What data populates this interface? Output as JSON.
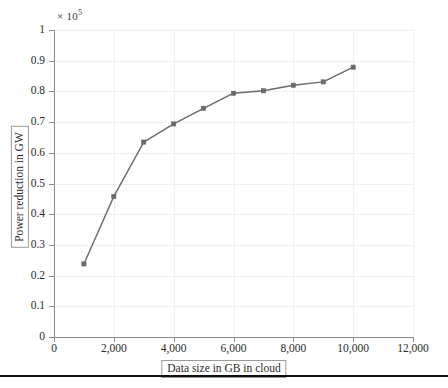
{
  "chart_data": {
    "type": "line",
    "title": "",
    "subtitle": "",
    "xlabel": "Data size in GB in cloud",
    "ylabel": "Power reduction in GW",
    "exponent_label": "× 10",
    "exponent_superscript": "5",
    "y_scale_factor": 100000,
    "xlim": [
      0,
      12000
    ],
    "ylim": [
      0,
      1
    ],
    "xticks": [
      0,
      2000,
      4000,
      6000,
      8000,
      10000,
      12000
    ],
    "xtick_labels": [
      "0",
      "2,000",
      "4,000",
      "6,000",
      "8,000",
      "10,000",
      "12,000"
    ],
    "yticks": [
      0,
      0.1,
      0.2,
      0.3,
      0.4,
      0.5,
      0.6,
      0.7,
      0.8,
      0.9,
      1
    ],
    "ytick_labels": [
      "0",
      "0.1",
      "0.2",
      "0.3",
      "0.4",
      "0.5",
      "0.6",
      "0.7",
      "0.8",
      "0.9",
      "1"
    ],
    "grid": true,
    "legend": false,
    "legend_position": "none",
    "marker": "square",
    "line_color": "#6b6b6b",
    "marker_color": "#6b6b6b",
    "grid_color": "#f0f0f2",
    "axis_color": "#8a8a8a",
    "x": [
      1000,
      2000,
      3000,
      4000,
      5000,
      6000,
      7000,
      8000,
      9000,
      10000
    ],
    "values": [
      0.238,
      0.458,
      0.635,
      0.694,
      0.745,
      0.794,
      0.802,
      0.82,
      0.831,
      0.879
    ],
    "series": [
      {
        "name": "Power reduction",
        "x": [
          1000,
          2000,
          3000,
          4000,
          5000,
          6000,
          7000,
          8000,
          9000,
          10000
        ],
        "values": [
          0.238,
          0.458,
          0.635,
          0.694,
          0.745,
          0.794,
          0.802,
          0.82,
          0.831,
          0.879
        ]
      }
    ],
    "annotations": []
  },
  "figure": {
    "background": "#ffffff",
    "bottom_rule_color": "#0d0d0d"
  }
}
